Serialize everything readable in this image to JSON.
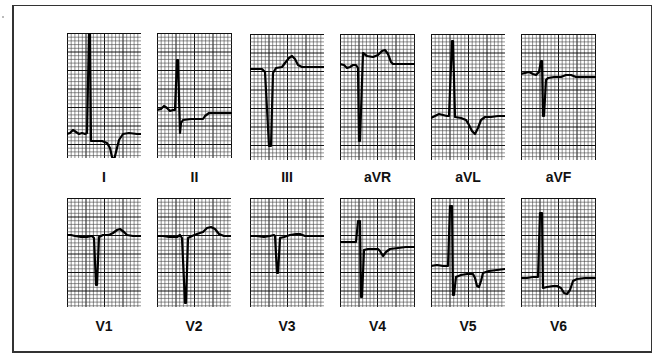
{
  "figure": {
    "rows": [
      {
        "leads": [
          {
            "name": "I",
            "x": 67,
            "y": 33,
            "w": 74,
            "h": 125,
            "label_y": 169,
            "path": "M0,101 L3,100 L6,97 L9,99 L12,101 L15,100 L18,101 L20,100 L22,0 L23,0 L24,108 L35,108 L40,110 L43,115 L45,124 L47,127 L50,115 L52,107 L56,101 L62,100 L70,101 L74,101"
          },
          {
            "name": "II",
            "x": 157,
            "y": 33,
            "w": 75,
            "h": 125,
            "label_y": 169,
            "path": "M0,77 L4,76 L7,73 L10,75 L13,78 L16,77 L18,77 L20,27 L21,27 L23,100 L24,90 L26,87 L34,86 L41,86 L46,86 L48,83 L52,80 L60,80 L68,80 L75,80"
          },
          {
            "name": "III",
            "x": 250,
            "y": 34,
            "w": 74,
            "h": 126,
            "label_y": 169,
            "path": "M0,35 L6,35 L12,35 L14,37 L15,38 L19,112 L21,112 L23,39 L26,34 L32,33 L35,29 L39,24 L42,22 L45,25 L48,31 L52,33 L58,33 L64,33 L74,33"
          },
          {
            "name": "aVR",
            "x": 340,
            "y": 34,
            "w": 75,
            "h": 126,
            "label_y": 169,
            "path": "M0,30 L4,31 L7,34 L10,33 L13,31 L16,31 L18,34 L19,107 L20,107 L23,19 L27,22 L33,23 L38,21 L42,17 L45,16 L48,20 L51,28 L53,30 L60,30 L68,30 L75,30"
          },
          {
            "name": "aVL",
            "x": 431,
            "y": 34,
            "w": 74,
            "h": 126,
            "label_y": 169,
            "path": "M0,84 L4,82 L8,80 L12,81 L16,82 L18,82 L21,7 L22,7 L24,83 L30,84 L35,86 L38,91 L41,97 L44,100 L47,94 L50,86 L54,83 L60,83 L67,82 L74,82"
          },
          {
            "name": "aVF",
            "x": 521,
            "y": 34,
            "w": 75,
            "h": 126,
            "label_y": 169,
            "path": "M0,40 L4,39 L8,38 L12,40 L15,41 L18,38 L20,27 L21,27 L22,82 L23,82 L25,46 L27,44 L33,43 L40,43 L45,41 L50,41 L55,43 L63,43 L75,43"
          }
        ]
      },
      {
        "leads": [
          {
            "name": "V1",
            "x": 67,
            "y": 198,
            "w": 74,
            "h": 109,
            "label_y": 318,
            "path": "M0,37 L4,37 L8,38 L14,39 L20,39 L25,38 L27,40 L29,87 L30,87 L32,39 L36,37 L42,37 L46,35 L50,32 L53,31 L57,34 L60,37 L66,38 L74,38"
          },
          {
            "name": "V2",
            "x": 157,
            "y": 198,
            "w": 74,
            "h": 109,
            "label_y": 318,
            "path": "M0,38 L6,38 L12,39 L20,39 L23,37 L25,40 L28,105 L29,105 L31,40 L35,38 L40,36 L46,34 L50,30 L54,29 L58,31 L62,36 L67,38 L74,38"
          },
          {
            "name": "V3",
            "x": 250,
            "y": 198,
            "w": 74,
            "h": 109,
            "label_y": 318,
            "path": "M0,38 L6,38 L14,39 L20,38 L24,37 L25,38 L27,75 L28,75 L30,40 L34,39 L40,37 L46,36 L50,36 L55,38 L62,38 L74,38"
          },
          {
            "name": "V4",
            "x": 340,
            "y": 198,
            "w": 75,
            "h": 109,
            "label_y": 318,
            "path": "M0,44 L6,44 L12,44 L16,44 L18,23 L20,23 L21,99 L22,99 L24,52 L28,51 L34,51 L38,51 L40,53 L43,58 L46,54 L50,51 L58,50 L66,49 L75,49"
          },
          {
            "name": "V5",
            "x": 431,
            "y": 198,
            "w": 74,
            "h": 109,
            "label_y": 318,
            "path": "M0,68 L6,67 L12,68 L17,68 L19,8 L21,8 L22,97 L23,97 L25,79 L30,77 L36,76 L42,76 L44,80 L46,88 L48,89 L50,83 L52,75 L58,73 L66,72 L74,71"
          },
          {
            "name": "V6",
            "x": 521,
            "y": 198,
            "w": 75,
            "h": 109,
            "label_y": 318,
            "path": "M0,80 L6,80 L12,79 L17,79 L19,15 L21,15 L22,90 L26,89 L32,88 L36,88 L40,90 L43,95 L46,96 L49,92 L52,83 L56,81 L64,80 L75,80"
          }
        ]
      }
    ]
  },
  "colors": {
    "grid_minor": "#444444",
    "grid_major": "#111111",
    "trace": "#000000",
    "frame": "#333333",
    "label": "#111111"
  }
}
